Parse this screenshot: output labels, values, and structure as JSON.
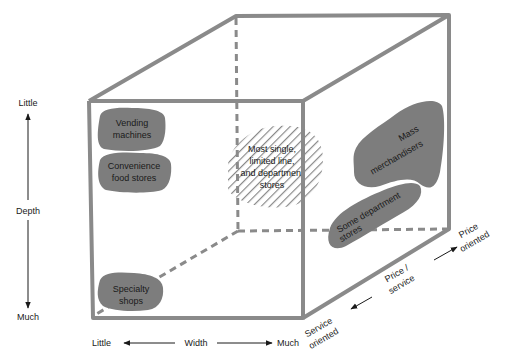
{
  "axes": {
    "depth": {
      "label": "Depth",
      "top": "Little",
      "bottom": "Much"
    },
    "width": {
      "label": "Width",
      "left": "Little",
      "right": "Much"
    },
    "price_service": {
      "label_line1": "Price /",
      "label_line2": "service",
      "front_line1": "Service",
      "front_line2": "oriented",
      "back_line1": "Price",
      "back_line2": "oriented"
    }
  },
  "regions": {
    "vending": {
      "line1": "Vending",
      "line2": "machines"
    },
    "convenience": {
      "line1": "Convenience",
      "line2": "food stores"
    },
    "specialty": {
      "line1": "Specialty",
      "line2": "shops"
    },
    "most_single": {
      "line1": "Most single,",
      "line2": "limited line,",
      "line3": "and department",
      "line4": "stores"
    },
    "mass": {
      "line1": "Mass",
      "line2": "merchandisers"
    },
    "some_dept": {
      "line1": "Some department",
      "line2": "stores"
    }
  },
  "colors": {
    "cube_edge": "#8a8a8a",
    "blob_fill": "#7d7d7d",
    "hatch": "#8a8a8a",
    "text": "#1a1a1a"
  }
}
